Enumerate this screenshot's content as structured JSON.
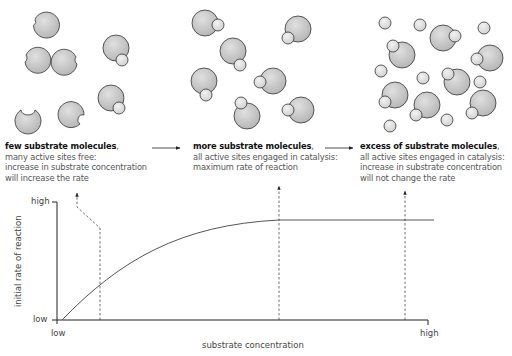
{
  "diagram": {
    "panels": [
      {
        "id": "few",
        "title": "few substrate molecules",
        "comma": ",",
        "lines": [
          "many active sites free:",
          "increase in substrate concentration",
          "will increase the rate"
        ]
      },
      {
        "id": "more",
        "title": "more substrate molecules",
        "comma": ",",
        "lines": [
          "all active sites engaged in catalysis:",
          "maximum rate of reaction"
        ]
      },
      {
        "id": "excess",
        "title": "excess of substrate molecules",
        "comma": ",",
        "lines": [
          "all active sites engaged in catalysis:",
          "increase in substrate concentration",
          "will not change the rate"
        ]
      }
    ],
    "graph": {
      "y_axis_label": "initial rate of reaction",
      "x_axis_label": "substrate concentration",
      "y_high": "high",
      "y_low": "low",
      "x_low": "low",
      "x_high": "high"
    },
    "colors": {
      "enzyme_fill": "#c8c8c8",
      "substrate_fill": "#e2e2e2",
      "outline": "#333333",
      "curve": "#555555",
      "title_text": "#111111",
      "body_text": "#555555"
    }
  }
}
